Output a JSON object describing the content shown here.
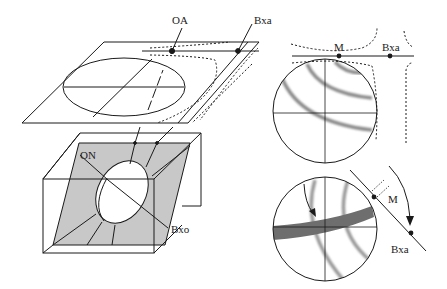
{
  "figure": {
    "colors": {
      "line": "#1a1a1a",
      "section_fill": "#c8c8c8",
      "isogyre": "#6e6e6e",
      "isochrome": "#9a9a9a",
      "background": "#ffffff"
    }
  },
  "labels": {
    "optic_axis": "OA",
    "bxa_top": "Bxa",
    "optic_normal": "ON",
    "bxo": "Bxo",
    "melatope_upper": "M",
    "bxa_upper_right": "Bxa",
    "melatope_lower": "M",
    "bxa_lower_right": "Bxa"
  },
  "panels": [
    {
      "id": "crystal-plate",
      "caption": ""
    },
    {
      "id": "indicatrix-box",
      "caption": ""
    },
    {
      "id": "figure-centered",
      "caption": ""
    },
    {
      "id": "figure-rotated",
      "caption": ""
    }
  ]
}
